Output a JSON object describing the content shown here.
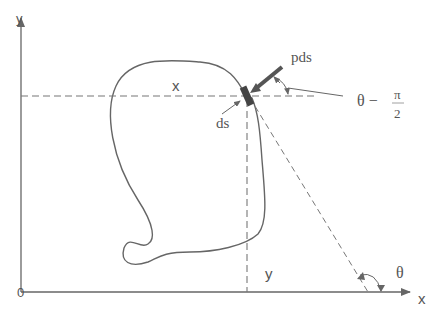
{
  "diagram": {
    "type": "free-body diagram of closed curve under pressure",
    "axes": {
      "x_label": "x",
      "y_label": "y",
      "origin_label": "0"
    },
    "labels": {
      "x_distance": "x",
      "y_distance": "y",
      "element": "ds",
      "force": "pds",
      "angle_theta": "θ",
      "angle_offset_prefix": "θ −",
      "pi_numerator": "π",
      "pi_denominator": "2"
    },
    "colors": {
      "line": "#666666",
      "element": "#444444",
      "text": "#555555",
      "background": "#ffffff"
    }
  }
}
